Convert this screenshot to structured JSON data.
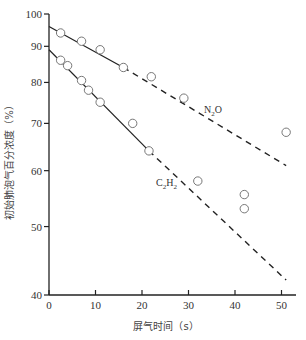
{
  "chart_data": {
    "type": "scatter",
    "title": "",
    "xlabel": "屏气时间（s）",
    "ylabel": "初始肺泡气百分浓度（%）",
    "xlim": [
      0,
      52
    ],
    "ylim": [
      40,
      100
    ],
    "y_scale": "log",
    "x_ticks": [
      0,
      10,
      20,
      30,
      40,
      50
    ],
    "y_ticks": [
      40,
      50,
      60,
      70,
      80,
      90,
      100
    ],
    "grid": false,
    "legend": "inline labels",
    "series": [
      {
        "name": "N2O",
        "label_display": "N₂O",
        "points": [
          [
            2.5,
            94
          ],
          [
            7,
            91.5
          ],
          [
            11,
            89
          ],
          [
            16,
            84
          ],
          [
            22,
            81.5
          ],
          [
            29,
            76
          ],
          [
            51,
            68
          ]
        ],
        "fit_line": {
          "solid": [
            [
              0,
              96
            ],
            [
              16,
              84
            ]
          ],
          "dashed": [
            [
              16,
              84
            ],
            [
              51,
              61
            ]
          ]
        }
      },
      {
        "name": "C2H2",
        "label_display": "C₂H₂",
        "points": [
          [
            2.5,
            86
          ],
          [
            4,
            84.5
          ],
          [
            7,
            80.5
          ],
          [
            8.5,
            78
          ],
          [
            11,
            75
          ],
          [
            18,
            70
          ],
          [
            21.5,
            64
          ],
          [
            32,
            58
          ],
          [
            42,
            55.5
          ],
          [
            42,
            53
          ]
        ],
        "fit_line": {
          "solid": [
            [
              0,
              89
            ],
            [
              21.5,
              64
            ]
          ],
          "dashed": [
            [
              21.5,
              64
            ],
            [
              51,
              42
            ]
          ]
        }
      }
    ]
  }
}
